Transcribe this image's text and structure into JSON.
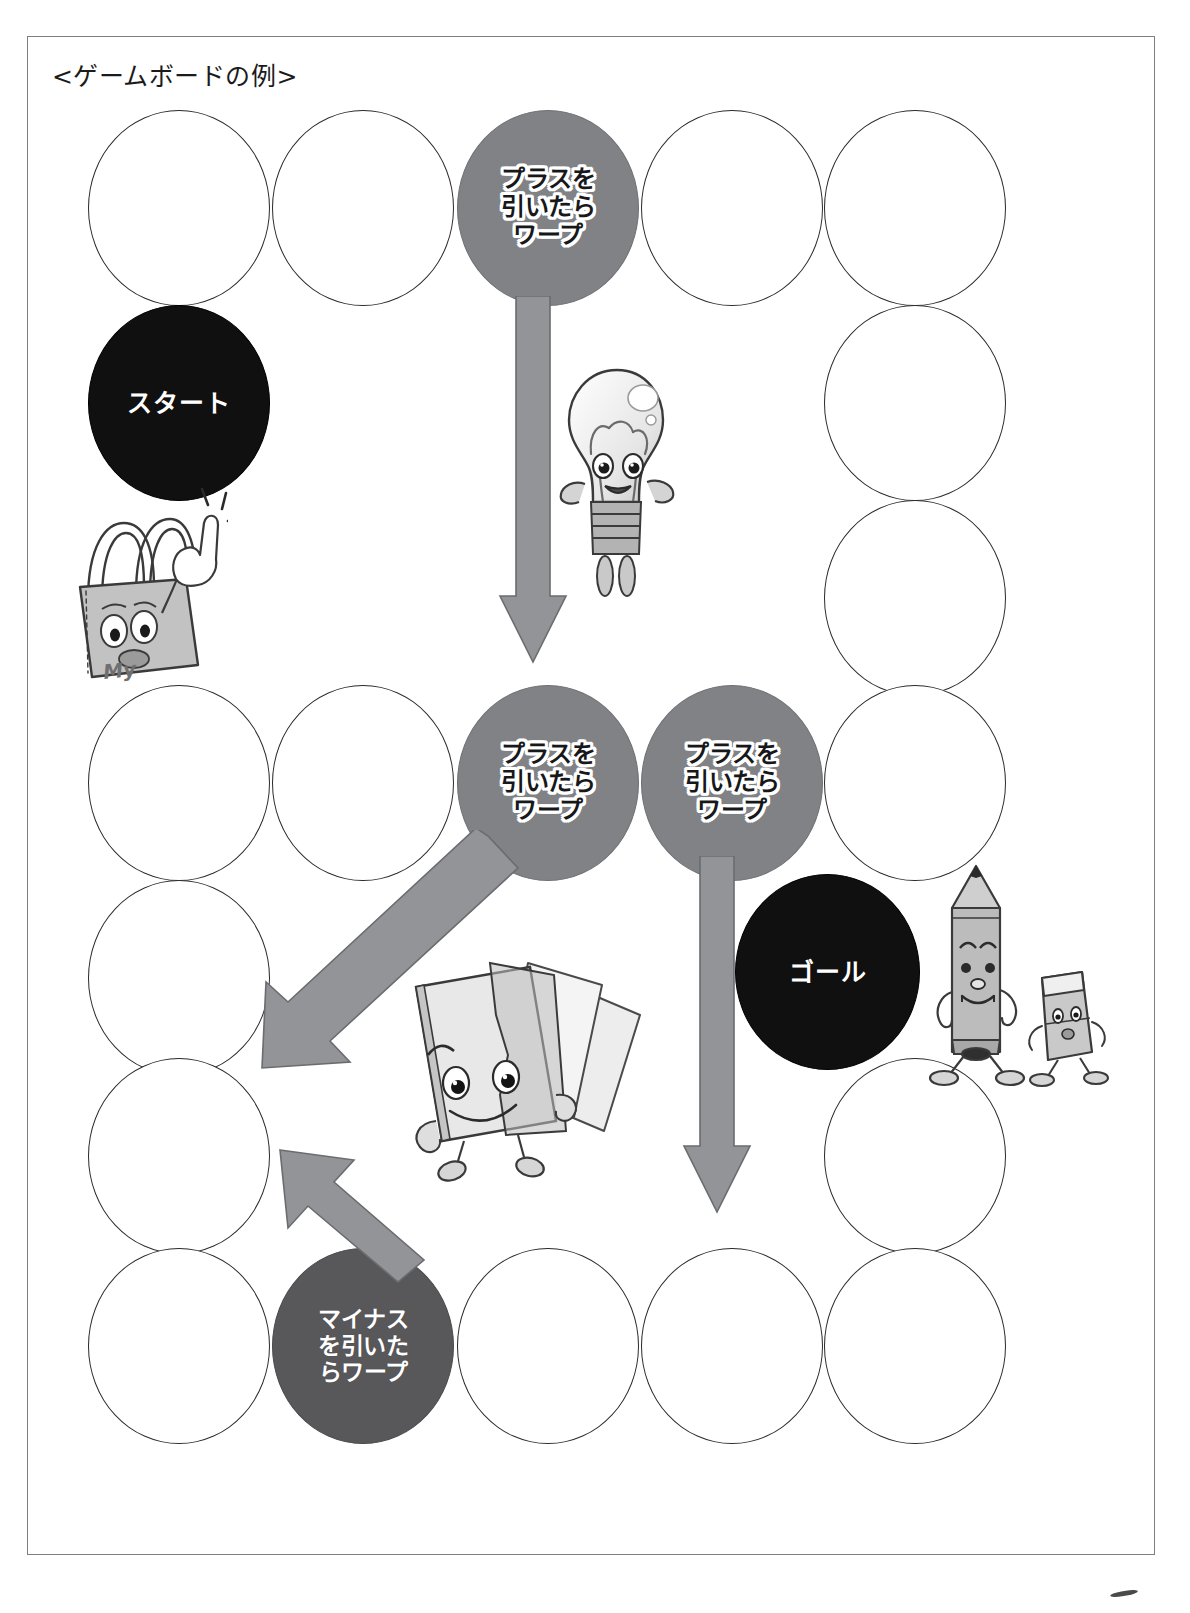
{
  "document": {
    "title": "<ゲームボードの例>",
    "page_bg": "#ffffff",
    "border_color": "#7b7f86"
  },
  "legend": {
    "plus_fill": "#808285",
    "minus_fill": "#58585b",
    "dark_fill": "#101010",
    "blank_stroke": "#2b2b2b",
    "arrow_fill": "#929497",
    "arrow_stroke": "#5e6063"
  },
  "labels": {
    "start": "スタート",
    "goal": "ゴール",
    "plus_warp": "プラスを\n引いたら\nワープ",
    "minus_warp": "マイナス\nを引いた\nらワープ"
  },
  "board": {
    "cells": [
      {
        "id": "c-top-1",
        "type": "blank",
        "label": "",
        "x": 88,
        "y": 110,
        "w": 182,
        "h": 196
      },
      {
        "id": "c-top-2",
        "type": "blank",
        "label": "",
        "x": 272,
        "y": 110,
        "w": 182,
        "h": 196
      },
      {
        "id": "c-top-3",
        "type": "plus",
        "label": "プラスを\n引いたら\nワープ",
        "x": 457,
        "y": 110,
        "w": 182,
        "h": 196
      },
      {
        "id": "c-top-4",
        "type": "blank",
        "label": "",
        "x": 641,
        "y": 110,
        "w": 182,
        "h": 196
      },
      {
        "id": "c-top-5",
        "type": "blank",
        "label": "",
        "x": 824,
        "y": 110,
        "w": 182,
        "h": 196
      },
      {
        "id": "c-left-start",
        "type": "dark",
        "label": "スタート",
        "x": 88,
        "y": 305,
        "w": 182,
        "h": 196
      },
      {
        "id": "c-right-2",
        "type": "blank",
        "label": "",
        "x": 824,
        "y": 305,
        "w": 182,
        "h": 196
      },
      {
        "id": "c-right-3",
        "type": "blank",
        "label": "",
        "x": 824,
        "y": 500,
        "w": 182,
        "h": 196
      },
      {
        "id": "c-mid-1",
        "type": "blank",
        "label": "",
        "x": 88,
        "y": 685,
        "w": 182,
        "h": 196
      },
      {
        "id": "c-mid-2",
        "type": "blank",
        "label": "",
        "x": 272,
        "y": 685,
        "w": 182,
        "h": 196
      },
      {
        "id": "c-mid-3",
        "type": "plus",
        "label": "プラスを\n引いたら\nワープ",
        "x": 457,
        "y": 685,
        "w": 182,
        "h": 196
      },
      {
        "id": "c-mid-4",
        "type": "plus",
        "label": "プラスを\n引いたら\nワープ",
        "x": 641,
        "y": 685,
        "w": 182,
        "h": 196
      },
      {
        "id": "c-mid-5",
        "type": "blank",
        "label": "",
        "x": 824,
        "y": 685,
        "w": 182,
        "h": 196
      },
      {
        "id": "c-left-2",
        "type": "blank",
        "label": "",
        "x": 88,
        "y": 880,
        "w": 182,
        "h": 196
      },
      {
        "id": "c-left-3",
        "type": "blank",
        "label": "",
        "x": 88,
        "y": 1058,
        "w": 182,
        "h": 196
      },
      {
        "id": "c-goal",
        "type": "dark",
        "label": "ゴール",
        "x": 735,
        "y": 874,
        "w": 185,
        "h": 196
      },
      {
        "id": "c-right-4",
        "type": "blank",
        "label": "",
        "x": 824,
        "y": 1058,
        "w": 182,
        "h": 196
      },
      {
        "id": "c-bot-1",
        "type": "blank",
        "label": "",
        "x": 88,
        "y": 1248,
        "w": 182,
        "h": 196
      },
      {
        "id": "c-bot-2",
        "type": "minus",
        "label": "マイナス\nを引いた\nらワープ",
        "x": 272,
        "y": 1248,
        "w": 182,
        "h": 196
      },
      {
        "id": "c-bot-3",
        "type": "blank",
        "label": "",
        "x": 457,
        "y": 1248,
        "w": 182,
        "h": 196
      },
      {
        "id": "c-bot-4",
        "type": "blank",
        "label": "",
        "x": 641,
        "y": 1248,
        "w": 182,
        "h": 196
      },
      {
        "id": "c-bot-5",
        "type": "blank",
        "label": "",
        "x": 824,
        "y": 1248,
        "w": 182,
        "h": 196
      }
    ],
    "arrows": [
      {
        "id": "arrow-down-top",
        "direction": "down",
        "from": "c-top-3",
        "to": "c-mid-3"
      },
      {
        "id": "arrow-diagonal",
        "direction": "down-left",
        "from": "c-mid-3",
        "to": "c-left-3"
      },
      {
        "id": "arrow-down-right",
        "direction": "down",
        "from": "c-mid-4",
        "to": "c-bot-4"
      },
      {
        "id": "arrow-up-left",
        "direction": "up-left",
        "from": "c-bot-2",
        "to": "c-left-3"
      }
    ]
  },
  "mascots": [
    {
      "id": "bag-mascot",
      "name": "shopping-bag-character",
      "text": "My"
    },
    {
      "id": "bulb-mascot",
      "name": "light-bulb-character",
      "text": ""
    },
    {
      "id": "card-mascot",
      "name": "paper-cards-character",
      "text": ""
    },
    {
      "id": "pencil-mascot",
      "name": "pencil-character",
      "text": ""
    },
    {
      "id": "eraser-mascot",
      "name": "eraser-character",
      "text": ""
    }
  ]
}
